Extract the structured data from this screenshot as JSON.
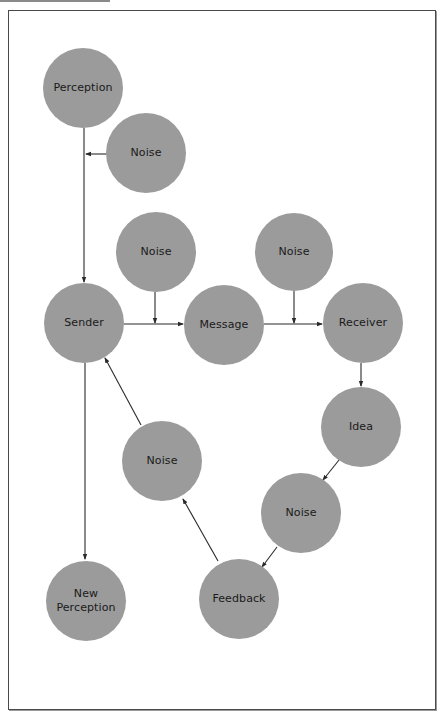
{
  "diagram": {
    "title": "",
    "colors": {
      "node_fill": "#9b9b9b",
      "text": "#1a1a1a",
      "line": "#2a2a2a",
      "frame": "#4a4a4a"
    },
    "nodes": {
      "perception": {
        "label": "Perception",
        "cx": 83,
        "cy": 88,
        "r": 40
      },
      "noise_top": {
        "label": "Noise",
        "cx": 146,
        "cy": 153,
        "r": 40
      },
      "noise_sender_message": {
        "label": "Noise",
        "cx": 156,
        "cy": 252,
        "r": 40
      },
      "noise_message_receiver": {
        "label": "Noise",
        "cx": 294,
        "cy": 252,
        "r": 39
      },
      "sender": {
        "label": "Sender",
        "cx": 84,
        "cy": 323,
        "r": 40
      },
      "message": {
        "label": "Message",
        "cx": 224,
        "cy": 325,
        "r": 40
      },
      "receiver": {
        "label": "Receiver",
        "cx": 363,
        "cy": 323,
        "r": 40
      },
      "idea": {
        "label": "Idea",
        "cx": 361,
        "cy": 427,
        "r": 40
      },
      "noise_feedback_sender": {
        "label": "Noise",
        "cx": 162,
        "cy": 461,
        "r": 40
      },
      "noise_idea_feedback": {
        "label": "Noise",
        "cx": 301,
        "cy": 513,
        "r": 40
      },
      "new_perception": {
        "label_line1": "New",
        "label_line2": "Perception",
        "cx": 86,
        "cy": 601,
        "r": 40
      },
      "feedback": {
        "label": "Feedback",
        "cx": 239,
        "cy": 599,
        "r": 40
      }
    },
    "edges": [
      {
        "from": "perception",
        "to": "sender"
      },
      {
        "from": "noise_top",
        "to": "perception-sender-line"
      },
      {
        "from": "sender",
        "to": "message"
      },
      {
        "from": "noise_sender_message",
        "to": "sender-message-line"
      },
      {
        "from": "message",
        "to": "receiver"
      },
      {
        "from": "noise_message_receiver",
        "to": "message-receiver-line"
      },
      {
        "from": "receiver",
        "to": "idea"
      },
      {
        "from": "idea",
        "to": "noise_idea_feedback"
      },
      {
        "from": "noise_idea_feedback",
        "to": "feedback"
      },
      {
        "from": "feedback",
        "to": "noise_feedback_sender"
      },
      {
        "from": "noise_feedback_sender",
        "to": "sender"
      },
      {
        "from": "sender",
        "to": "new_perception"
      }
    ]
  }
}
